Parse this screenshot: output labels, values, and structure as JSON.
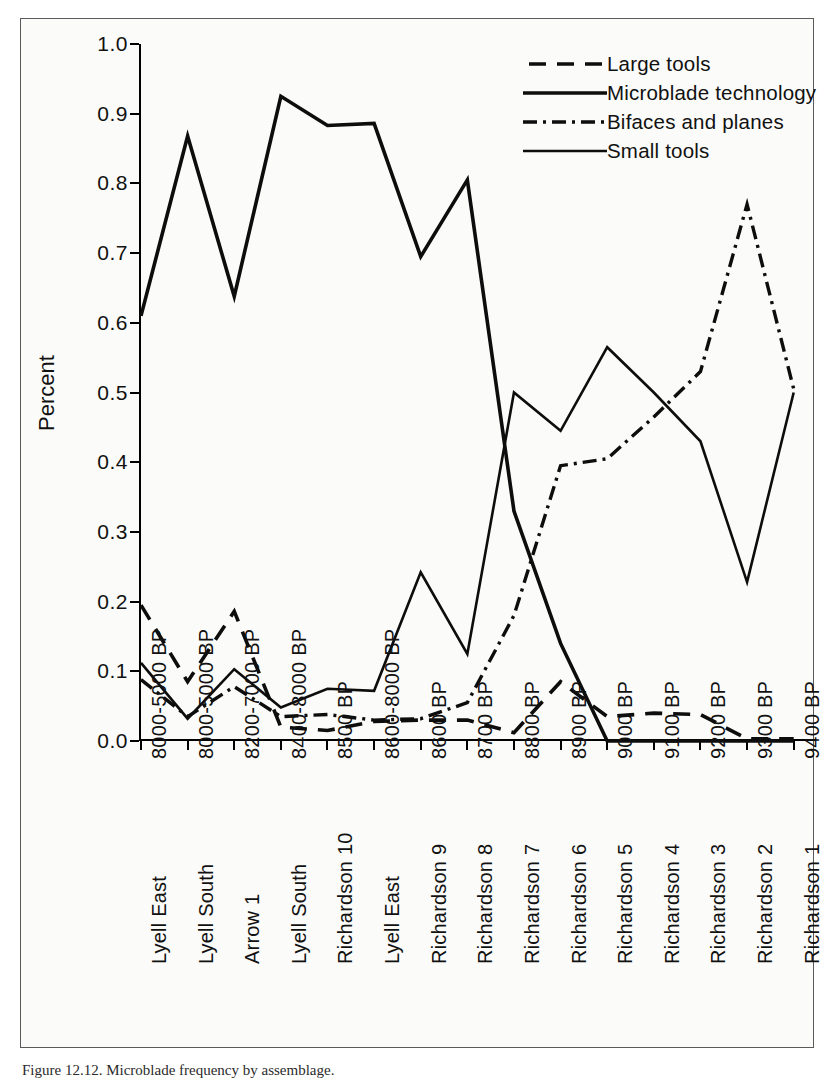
{
  "figure": {
    "caption": "Figure 12.12.  Microblade frequency by assemblage.",
    "y_axis_title": "Percent"
  },
  "legend": {
    "position": "top-right",
    "entries": [
      {
        "label": "Large tools",
        "style": "long-dash",
        "swatch_name": "legend-swatch-large-tools"
      },
      {
        "label": "Microblade technology",
        "style": "solid-thick",
        "swatch_name": "legend-swatch-microblade"
      },
      {
        "label": "Bifaces and planes",
        "style": "dash-dot",
        "swatch_name": "legend-swatch-bifaces"
      },
      {
        "label": "Small tools",
        "style": "solid-thin",
        "swatch_name": "legend-swatch-small-tools"
      }
    ]
  },
  "chart_data": {
    "type": "line",
    "title": "",
    "xlabel": "",
    "ylabel": "Percent",
    "ylim": [
      0.0,
      1.0
    ],
    "ytick_labels": [
      "0.0",
      "0.1",
      "0.2",
      "0.3",
      "0.4",
      "0.5",
      "0.6",
      "0.7",
      "0.8",
      "0.9",
      "1.0"
    ],
    "ytick_values": [
      0.0,
      0.1,
      0.2,
      0.3,
      0.4,
      0.5,
      0.6,
      0.7,
      0.8,
      0.9,
      1.0
    ],
    "grid": false,
    "legend_position": "top-right",
    "categories": [
      "8000-5000 BP",
      "8000-5000 BP",
      "8200-7000 BP",
      "8400-8000 BP",
      "8500 BP",
      "8600-8000 BP",
      "8600 BP",
      "8700 BP",
      "8800 BP",
      "8900 BP",
      "9000 BP",
      "9100 BP",
      "9200 BP",
      "9300 BP",
      "9400 BP"
    ],
    "category_sites": [
      "Lyell East",
      "Lyell South",
      "Arrow 1",
      "Lyell South",
      "Richardson 10",
      "Lyell East",
      "Richardson 9",
      "Richardson 8",
      "Richardson 7",
      "Richardson 6",
      "Richardson 5",
      "Richardson 4",
      "Richardson 3",
      "Richardson 2",
      "Richardson 1"
    ],
    "series": [
      {
        "name": "Large tools",
        "style": "long-dash",
        "values": [
          0.195,
          0.085,
          0.186,
          0.02,
          0.015,
          0.028,
          0.03,
          0.03,
          0.012,
          0.085,
          0.035,
          0.04,
          0.038,
          0.003,
          0.003
        ]
      },
      {
        "name": "Microblade technology",
        "style": "solid-thick",
        "values": [
          0.61,
          0.868,
          0.638,
          0.925,
          0.883,
          0.886,
          0.695,
          0.805,
          0.33,
          0.14,
          0.0,
          0.0,
          0.0,
          0.0,
          0.0
        ]
      },
      {
        "name": "Bifaces and planes",
        "style": "dash-dot",
        "values": [
          0.088,
          0.035,
          0.078,
          0.035,
          0.038,
          0.03,
          0.032,
          0.055,
          0.18,
          0.395,
          0.405,
          0.465,
          0.53,
          0.77,
          0.505
        ]
      },
      {
        "name": "Small tools",
        "style": "solid-thin",
        "values": [
          0.112,
          0.032,
          0.103,
          0.048,
          0.075,
          0.072,
          0.242,
          0.125,
          0.5,
          0.445,
          0.565,
          0.5,
          0.43,
          0.228,
          0.5
        ]
      }
    ]
  }
}
